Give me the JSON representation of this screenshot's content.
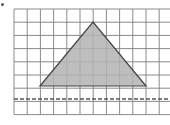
{
  "diagram": {
    "type": "grid-with-triangle",
    "grid": {
      "left": 14,
      "top": 9,
      "cell_size": 13.2,
      "columns": 12,
      "rows": 8,
      "line_color": "#8a8a8a",
      "background": "#ffffff"
    },
    "triangle": {
      "points": [
        [
          40,
          86
        ],
        [
          93,
          22
        ],
        [
          146,
          86
        ]
      ],
      "grid_points": [
        [
          2,
          6
        ],
        [
          6,
          1
        ],
        [
          10,
          6
        ]
      ],
      "fill": "#b3b3b3",
      "stroke": "#444444"
    },
    "dashed_line": {
      "y": 99,
      "grid_row": 7,
      "color": "#555555"
    },
    "marker": "dot"
  }
}
